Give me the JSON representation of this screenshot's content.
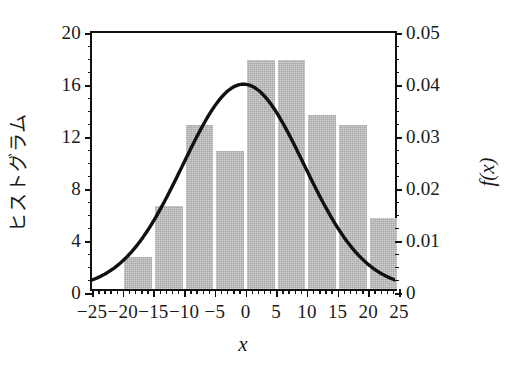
{
  "chart_data": {
    "type": "bar",
    "title": "",
    "xlabel": "x",
    "ylabel_left": "ヒストグラム",
    "ylabel_right": "f(x)",
    "xlim": [
      -25,
      25
    ],
    "ylim_left": [
      0,
      20
    ],
    "ylim_right": [
      0,
      0.05
    ],
    "grid": false,
    "legend": "none",
    "bar_color": "#a6a6a6",
    "curve_color": "#111111",
    "bin_width": 5,
    "x_ticks": [
      -25,
      -20,
      -15,
      -10,
      -5,
      0,
      5,
      10,
      15,
      20,
      25
    ],
    "x_tick_labels": [
      "−25",
      "−20",
      "−15",
      "−10",
      "−5",
      "0",
      "5",
      "10",
      "15",
      "20",
      "25"
    ],
    "x_minor_step": 1,
    "y_ticks_left": [
      0,
      4,
      8,
      12,
      16,
      20
    ],
    "y_tick_labels_left": [
      "0",
      "4",
      "8",
      "12",
      "16",
      "20"
    ],
    "y_minor_step_left": 1,
    "y_ticks_right": [
      0,
      0.01,
      0.02,
      0.03,
      0.04,
      0.05
    ],
    "y_tick_labels_right": [
      "0",
      "0.01",
      "0.02",
      "0.03",
      "0.04",
      "0.05"
    ],
    "y_minor_step_right": 0.0025,
    "bars": [
      {
        "bin_start": -20,
        "bin_end": -15,
        "center": -17.5,
        "value": 2.5
      },
      {
        "bin_start": -15,
        "bin_end": -10,
        "center": -12.5,
        "value": 6.4
      },
      {
        "bin_start": -10,
        "bin_end": -5,
        "center": -7.5,
        "value": 12.6
      },
      {
        "bin_start": -5,
        "bin_end": 0,
        "center": -2.5,
        "value": 10.6
      },
      {
        "bin_start": 0,
        "bin_end": 5,
        "center": 2.5,
        "value": 17.6
      },
      {
        "bin_start": 5,
        "bin_end": 10,
        "center": 7.5,
        "value": 17.6
      },
      {
        "bin_start": 10,
        "bin_end": 15,
        "center": 12.5,
        "value": 13.4
      },
      {
        "bin_start": 15,
        "bin_end": 20,
        "center": 17.5,
        "value": 12.6
      },
      {
        "bin_start": 20,
        "bin_end": 25,
        "center": 22.5,
        "value": 5.5
      }
    ],
    "bar_centers": [
      -17.5,
      -12.5,
      -7.5,
      -2.5,
      2.5,
      7.5,
      12.5,
      17.5,
      22.5
    ],
    "bar_values": [
      2.5,
      6.4,
      12.6,
      10.6,
      17.6,
      17.6,
      13.4,
      12.6,
      5.5
    ],
    "curve": {
      "name": "normal-pdf",
      "mean": 0,
      "sigma": 10,
      "peak": 0.04,
      "axis": "right"
    }
  }
}
